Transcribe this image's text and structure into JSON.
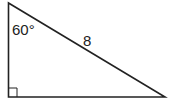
{
  "diagram": {
    "type": "right-triangle",
    "angle_label": "60°",
    "hypotenuse_label": "8",
    "right_angle_marker": true,
    "stroke_color": "#222222",
    "background_color": "#ffffff"
  }
}
